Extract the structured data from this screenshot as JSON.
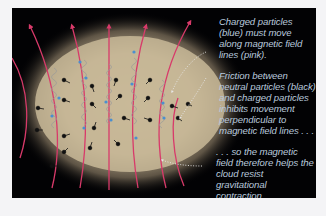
{
  "figure": {
    "background_color": "#020204",
    "cloud_color": "#c9b99a",
    "field_line_color": "#d83a6a",
    "charged_particle_color": "#4a8fd0",
    "neutral_particle_color": "#111111",
    "text_color": "#b9c9dd",
    "field_line_count": 7,
    "legend": {
      "charged_particles": "blue",
      "neutral_particles": "black",
      "magnetic_field_lines": "pink"
    }
  },
  "annotations": [
    {
      "id": "charged",
      "text": "Charged particles (blue) must move along magnetic field lines (pink)."
    },
    {
      "id": "friction",
      "text": "Friction between neutral particles (black) and charged particles inhibits movement perpendicular to magnetic field lines . . ."
    },
    {
      "id": "conclusion",
      "text": ". . . so the magnetic field therefore helps the cloud resist gravitational contraction."
    }
  ]
}
